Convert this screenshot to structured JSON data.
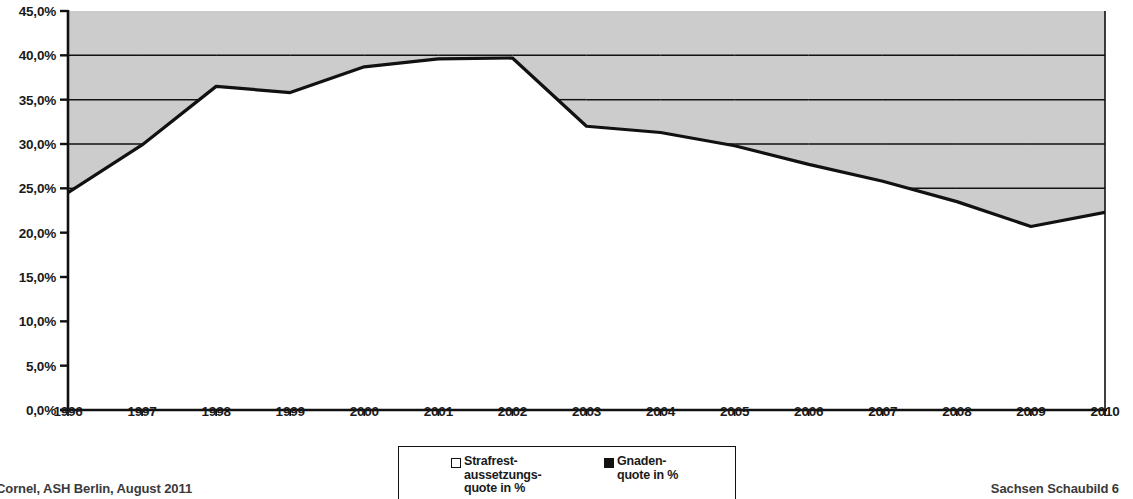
{
  "chart_data": {
    "type": "area",
    "title": "",
    "subtitle": "",
    "xlabel": "",
    "ylabel": "",
    "categories": [
      "1996",
      "1997",
      "1998",
      "1999",
      "2000",
      "2001",
      "2002",
      "2003",
      "2004",
      "2005",
      "2006",
      "2007",
      "2008",
      "2009",
      "2010"
    ],
    "series": [
      {
        "name": "Strafrestaussetzungsquote in %",
        "marker": "open-square",
        "values": [
          24.5,
          29.9,
          36.5,
          35.8,
          38.7,
          39.6,
          39.7,
          32.0,
          31.3,
          29.8,
          27.7,
          25.8,
          23.5,
          20.7,
          22.3
        ]
      },
      {
        "name": "Gnadenquote in %",
        "marker": "filled-square",
        "values": [
          0.0,
          0.0,
          0.0,
          0.0,
          0.0,
          0.0,
          0.0,
          0.0,
          0.0,
          0.0,
          0.0,
          0.0,
          0.0,
          0.0,
          0.0
        ]
      }
    ],
    "ylim": [
      0,
      45
    ],
    "yticks": [
      0,
      5,
      10,
      15,
      20,
      25,
      30,
      35,
      40,
      45
    ],
    "ytick_labels": [
      "0,0%",
      "5,0%",
      "10,0%",
      "15,0%",
      "20,0%",
      "25,0%",
      "30,0%",
      "35,0%",
      "40,0%",
      "45,0%"
    ],
    "grid": "horizontal-above-area-only",
    "legend_position": "bottom-center",
    "area_fill": "#cccccc",
    "line_color": "#111111"
  },
  "axes": {
    "y_labels": [
      "45,0%",
      "40,0%",
      "35,0%",
      "30,0%",
      "25,0%",
      "20,0%",
      "15,0%",
      "10,0%",
      "5,0%",
      "0,0%"
    ],
    "x_labels": [
      "1996",
      "1997",
      "1998",
      "1999",
      "2000",
      "2001",
      "2002",
      "2003",
      "2004",
      "2005",
      "2006",
      "2007",
      "2008",
      "2009",
      "2010"
    ]
  },
  "legend": {
    "entries": [
      {
        "label": "Strafrest-\naussetzungs-\nquote in %",
        "marker": "open-square"
      },
      {
        "label": "Gnaden-\nquote in %",
        "marker": "filled-square"
      }
    ]
  },
  "footer": {
    "left": "Cornel, ASH Berlin, August 2011",
    "right": "Sachsen Schaubild 6"
  },
  "colors": {
    "area": "#cccccc",
    "line": "#111111",
    "axis": "#111111",
    "text": "#1a1a1a"
  }
}
